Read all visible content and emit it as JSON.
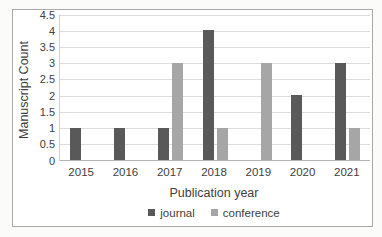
{
  "chart_data": {
    "type": "bar",
    "title": "",
    "categories": [
      "2015",
      "2016",
      "2017",
      "2018",
      "2019",
      "2020",
      "2021"
    ],
    "series": [
      {
        "name": "journal",
        "color": "#595959",
        "values": [
          1,
          1,
          1,
          4,
          0,
          2,
          3
        ]
      },
      {
        "name": "conference",
        "color": "#a6a6a6",
        "values": [
          0,
          0,
          3,
          1,
          3,
          0,
          1
        ]
      }
    ],
    "xlabel": "Publication year",
    "ylabel": "Manuscript Count",
    "ylim": [
      0,
      4.5
    ],
    "ytick_step": 0.5,
    "yticks": [
      "0",
      "0.5",
      "1",
      "1.5",
      "2",
      "2.5",
      "3",
      "3.5",
      "4",
      "4.5"
    ],
    "grid": true,
    "legend_position": "bottom"
  }
}
